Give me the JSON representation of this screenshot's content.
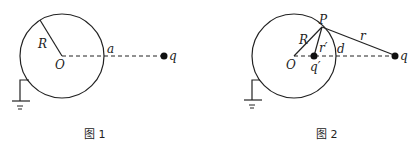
{
  "figures": [
    {
      "caption": "图 1",
      "labels": {
        "radius": "R",
        "center": "O",
        "distance": "a",
        "charge": "q"
      }
    },
    {
      "caption": "图 2",
      "labels": {
        "point": "P",
        "radius": "R",
        "r_prime": "r′",
        "center": "O",
        "image_charge": "q′",
        "distance": "d",
        "r": "r",
        "charge": "q"
      }
    }
  ],
  "colors": {
    "stroke": "#222222",
    "background": "#ffffff"
  }
}
